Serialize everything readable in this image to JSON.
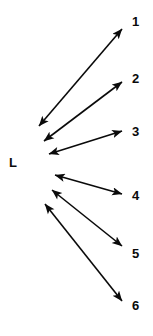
{
  "figure": {
    "width": 153,
    "height": 336,
    "background_color": "#ffffff",
    "stroke_color": "#0a0a0a",
    "stroke_width": 1.6,
    "arrowhead_style": "double-headed"
  },
  "origin": {
    "label": "L",
    "x": 14,
    "y": 163
  },
  "chart_data": {
    "type": "diagram",
    "title": "",
    "node_count": 7,
    "origin_label": "L",
    "endpoint_labels": [
      "1",
      "2",
      "3",
      "4",
      "5",
      "6"
    ],
    "arrows": [
      {
        "id": "arrow-1",
        "label": "1",
        "tail_x": 39,
        "tail_y": 126,
        "head_x": 122,
        "head_y": 29,
        "label_x": 132,
        "label_y": 15,
        "double_headed": true
      },
      {
        "id": "arrow-2",
        "label": "2",
        "tail_x": 44,
        "tail_y": 141,
        "head_x": 122,
        "head_y": 82,
        "label_x": 132,
        "label_y": 72,
        "double_headed": true
      },
      {
        "id": "arrow-3",
        "label": "3",
        "tail_x": 49,
        "tail_y": 154,
        "head_x": 122,
        "head_y": 131,
        "label_x": 132,
        "label_y": 125,
        "double_headed": true
      },
      {
        "id": "arrow-4",
        "label": "4",
        "tail_x": 55,
        "tail_y": 175,
        "head_x": 122,
        "head_y": 194,
        "label_x": 132,
        "label_y": 189,
        "double_headed": true
      },
      {
        "id": "arrow-5",
        "label": "5",
        "tail_x": 52,
        "tail_y": 190,
        "head_x": 122,
        "head_y": 246,
        "label_x": 132,
        "label_y": 247,
        "double_headed": true
      },
      {
        "id": "arrow-6",
        "label": "6",
        "tail_x": 45,
        "tail_y": 204,
        "head_x": 122,
        "head_y": 301,
        "label_x": 132,
        "label_y": 299,
        "double_headed": true
      }
    ]
  }
}
